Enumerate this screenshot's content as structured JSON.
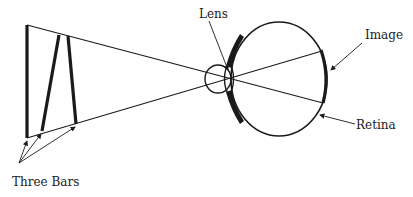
{
  "diagram": {
    "type": "optics-eye-image-formation",
    "labels": {
      "lens": "Lens",
      "image": "Image",
      "retina": "Retina",
      "three_bars": "Three Bars"
    },
    "colors": {
      "stroke": "#1a1a1a",
      "background": "#ffffff"
    },
    "objects": {
      "bars": [
        {
          "name": "bar-1",
          "x1": 27,
          "y1": 25,
          "x2": 27,
          "y2": 138
        },
        {
          "name": "bar-2",
          "x1": 59,
          "y1": 35,
          "x2": 42,
          "y2": 131
        },
        {
          "name": "bar-3",
          "x1": 68,
          "y1": 36,
          "x2": 76,
          "y2": 124
        }
      ],
      "rays": [
        {
          "name": "upper-ray",
          "from": [
            27,
            25
          ],
          "to": [
            323,
            103
          ]
        },
        {
          "name": "lower-ray",
          "from": [
            27,
            138
          ],
          "to": [
            322,
            51
          ]
        }
      ]
    }
  }
}
